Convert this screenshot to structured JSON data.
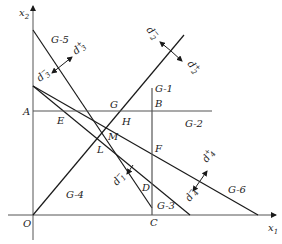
{
  "diagram": {
    "type": "goal-programming-feasible-region",
    "axes": {
      "x_label": "x",
      "x_sub": "1",
      "y_label": "x",
      "y_sub": "2",
      "origin_label": "O"
    },
    "constraint_labels": {
      "g1": "G-1",
      "g2": "G-2",
      "g3": "G-3",
      "g4": "G-4",
      "g5": "G-5",
      "g6": "G-6"
    },
    "points": {
      "A": "A",
      "B": "B",
      "C": "C",
      "D": "D",
      "E": "E",
      "F": "F",
      "G": "G",
      "H": "H",
      "L": "L",
      "M": "M"
    },
    "deviation_labels": {
      "d1_minus": "d",
      "d1_minus_sub": "1",
      "d1_minus_sup": "−",
      "d2_minus": "d",
      "d2_minus_sub": "2",
      "d2_minus_sup": "−",
      "d2_plus": "d",
      "d2_plus_sub": "2",
      "d2_plus_sup": "+",
      "d3_minus": "d",
      "d3_minus_sub": "3",
      "d3_minus_sup": "−",
      "d3_plus": "d",
      "d3_plus_sub": "3",
      "d3_plus_sup": "+",
      "d4_minus": "d",
      "d4_minus_sub": "4",
      "d4_minus_sup": "−",
      "d4_plus": "d",
      "d4_plus_sub": "4",
      "d4_plus_sup": "+"
    },
    "colors": {
      "line": "#1a1a1a",
      "axis": "#555555",
      "background": "#ffffff"
    }
  }
}
